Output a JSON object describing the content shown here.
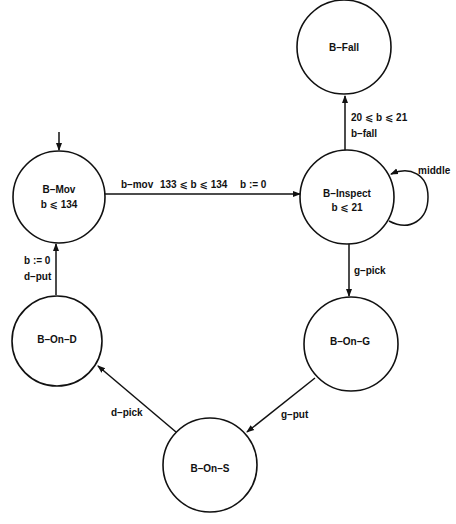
{
  "diagram": {
    "type": "timed automaton",
    "colors": {
      "stroke": "#111111",
      "background": "#ffffff",
      "text": "#111111"
    },
    "states": [
      {
        "id": "b_mov",
        "name": "B–Mov",
        "invariant": "b ⩽ 134",
        "initial": true,
        "cx": 59,
        "cy": 197,
        "r": 46
      },
      {
        "id": "b_fall",
        "name": "B–Fall",
        "invariant": "",
        "initial": false,
        "cx": 344,
        "cy": 47,
        "r": 47
      },
      {
        "id": "b_inspect",
        "name": "B–Inspect",
        "invariant": "b ⩽ 21",
        "initial": false,
        "cx": 347,
        "cy": 197,
        "r": 47
      },
      {
        "id": "b_on_g",
        "name": "B–On–G",
        "invariant": "",
        "initial": false,
        "cx": 351,
        "cy": 344,
        "r": 47
      },
      {
        "id": "b_on_d",
        "name": "B–On–D",
        "invariant": "",
        "initial": false,
        "cx": 57,
        "cy": 341,
        "r": 45
      },
      {
        "id": "b_on_s",
        "name": "B–On–S",
        "invariant": "",
        "initial": false,
        "cx": 210,
        "cy": 465,
        "r": 47
      }
    ],
    "transitions": [
      {
        "from": "b_mov",
        "to": "b_inspect",
        "action": "b–mov",
        "guard": "133 ⩽ b ⩽ 134",
        "reset": "b := 0"
      },
      {
        "from": "b_inspect",
        "to": "b_fall",
        "action": "b–fall",
        "guard": "20 ⩽ b ⩽ 21",
        "reset": ""
      },
      {
        "from": "b_inspect",
        "to": "b_inspect",
        "action": "middle",
        "guard": "",
        "reset": ""
      },
      {
        "from": "b_inspect",
        "to": "b_on_g",
        "action": "g–pick",
        "guard": "",
        "reset": ""
      },
      {
        "from": "b_on_g",
        "to": "b_on_s",
        "action": "g–put",
        "guard": "",
        "reset": ""
      },
      {
        "from": "b_on_s",
        "to": "b_on_d",
        "action": "d–pick",
        "guard": "",
        "reset": ""
      },
      {
        "from": "b_on_d",
        "to": "b_mov",
        "action": "d–put",
        "guard": "",
        "reset": "b := 0"
      }
    ]
  }
}
